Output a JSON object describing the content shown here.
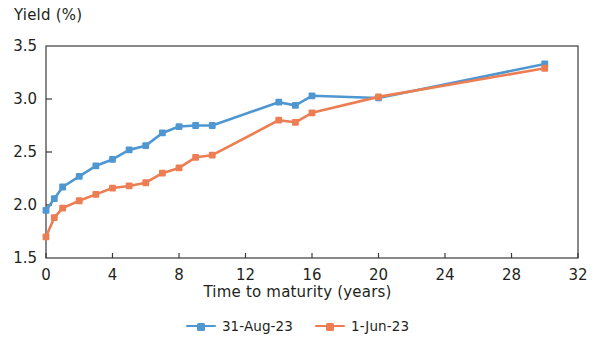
{
  "chart_data": {
    "type": "line",
    "title": "",
    "xlabel": "Time to maturity (years)",
    "ylabel": "Yield (%)",
    "xlim": [
      0,
      32
    ],
    "ylim": [
      1.5,
      3.5
    ],
    "xticks": [
      0,
      4,
      8,
      12,
      16,
      20,
      24,
      28,
      32
    ],
    "xtick_labels": [
      "0",
      "4",
      "8",
      "12",
      "16",
      "20",
      "24",
      "28",
      "32"
    ],
    "yticks": [
      1.5,
      2.0,
      2.5,
      3.0,
      3.5
    ],
    "ytick_labels": [
      "1.5",
      "2.0",
      "2.5",
      "3.0",
      "3.5"
    ],
    "grid": false,
    "legend_position": "bottom",
    "x": [
      0,
      0.5,
      1,
      2,
      3,
      4,
      5,
      6,
      7,
      8,
      9,
      10,
      14,
      15,
      16,
      20,
      30
    ],
    "series": [
      {
        "name": "31-Aug-23",
        "color": "#4E97D1",
        "marker": "square",
        "values": [
          1.95,
          2.06,
          2.17,
          2.27,
          2.37,
          2.43,
          2.52,
          2.56,
          2.68,
          2.74,
          2.75,
          2.75,
          2.97,
          2.94,
          3.03,
          3.01,
          3.33
        ]
      },
      {
        "name": "1-Jun-23",
        "color": "#ED7D52",
        "marker": "square",
        "values": [
          1.7,
          1.88,
          1.97,
          2.04,
          2.1,
          2.16,
          2.18,
          2.21,
          2.3,
          2.35,
          2.45,
          2.47,
          2.8,
          2.78,
          2.87,
          3.02,
          3.29
        ]
      }
    ]
  },
  "axis": {
    "ylabel": "Yield (%)",
    "xlabel": "Time to maturity (years)"
  },
  "legend": {
    "items": [
      {
        "label": "31-Aug-23",
        "color": "#4E97D1"
      },
      {
        "label": "1-Jun-23",
        "color": "#ED7D52"
      }
    ]
  }
}
